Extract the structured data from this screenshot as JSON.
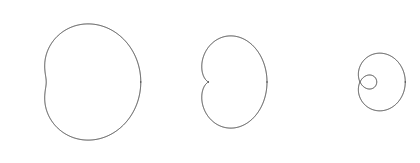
{
  "figure": {
    "background_color": "#ffffff",
    "width": 420,
    "height": 163,
    "stroke_color": "#3a3a3a",
    "stroke_width": 1.0,
    "fill": "none"
  },
  "chart_data": {
    "type": "line",
    "subtitle": "",
    "xlabel": "",
    "ylabel": "",
    "grid": false,
    "legend_position": "none",
    "axes_visible": false,
    "tick_labels": [],
    "annotations": [],
    "coordinate_system": "polar",
    "equation_form": "r = b + a*cos(theta)",
    "theta_range_deg": [
      0,
      360
    ],
    "series": [
      {
        "name": "dimpled-limacon",
        "label": "Dimpled limacon (b > a, b < 2a)",
        "a": 1.0,
        "b": 1.55,
        "loop": false,
        "cusp": false,
        "dimple": true,
        "center_x": 63,
        "center_y": 82,
        "scale_x": 30.5,
        "scale_y": 32.5,
        "rotation_deg": 0,
        "bbox": [
          14,
          12,
          127,
          152
        ]
      },
      {
        "name": "cardioid",
        "label": "Cardioid (b = a)",
        "a": 1.0,
        "b": 1.0,
        "loop": false,
        "cusp": true,
        "dimple": false,
        "center_x": 209,
        "center_y": 82,
        "scale_x": 29.0,
        "scale_y": 35.5,
        "rotation_deg": 0,
        "bbox": [
          152,
          17,
          266,
          150
        ]
      },
      {
        "name": "looped-limacon",
        "label": "Limacon with inner loop (b < a)",
        "a": 1.0,
        "b": 0.46,
        "loop": true,
        "cusp": false,
        "dimple": false,
        "center_x": 360,
        "center_y": 82,
        "scale_x": 31.0,
        "scale_y": 34.0,
        "rotation_deg": 0,
        "bbox": [
          298,
          13,
          412,
          152
        ],
        "inner_loop_bbox": [
          373,
          68,
          407,
          98
        ]
      }
    ]
  }
}
